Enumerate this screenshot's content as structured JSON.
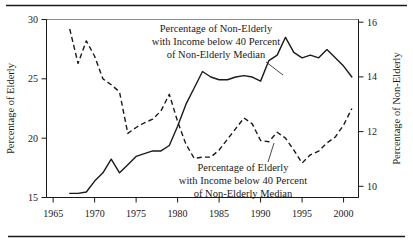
{
  "chart_data": {
    "type": "line",
    "title": "",
    "xlabel": "",
    "ylabel": "Percentage of Elderly",
    "y2label": "Percentage of Non-Elderly",
    "xlim": [
      1964.2,
      2001.8
    ],
    "ylim": [
      15,
      30
    ],
    "y2lim": [
      9.6,
      16.1
    ],
    "xticks": [
      1965,
      1970,
      1975,
      1980,
      1985,
      1990,
      1995,
      2000
    ],
    "yticks": [
      15,
      20,
      25,
      30
    ],
    "y2ticks": [
      10,
      12,
      14,
      16
    ],
    "grid": false,
    "legend_position": "inline-annotations",
    "series": [
      {
        "name": "Percentage of Elderly with Income below 40 Percent of Non-Elderly Median",
        "axis": "left",
        "style": "dashed",
        "x": [
          1967,
          1968,
          1969,
          1970,
          1971,
          1972,
          1973,
          1974,
          1975,
          1976,
          1977,
          1978,
          1979,
          1980,
          1981,
          1982,
          1983,
          1984,
          1985,
          1986,
          1987,
          1988,
          1989,
          1990,
          1991,
          1992,
          1993,
          1994,
          1995,
          1996,
          1997,
          1998,
          1999,
          2000,
          2001
        ],
        "values": [
          29.2,
          26.3,
          28.2,
          26.9,
          25.0,
          24.5,
          23.9,
          20.4,
          20.9,
          21.3,
          21.6,
          22.3,
          23.7,
          21.4,
          19.5,
          18.3,
          18.4,
          18.4,
          19.0,
          19.9,
          20.8,
          21.7,
          21.2,
          19.8,
          19.7,
          20.5,
          20.0,
          19.0,
          17.9,
          18.6,
          18.9,
          19.6,
          20.1,
          21.1,
          22.5
        ]
      },
      {
        "name": "Percentage of Non-Elderly with Income below 40 Percent of Non-Elderly Median",
        "axis": "right",
        "style": "solid",
        "x": [
          1967,
          1968,
          1969,
          1970,
          1971,
          1972,
          1973,
          1974,
          1975,
          1976,
          1977,
          1978,
          1979,
          1980,
          1981,
          1982,
          1983,
          1984,
          1985,
          1986,
          1987,
          1988,
          1989,
          1990,
          1991,
          1992,
          1993,
          1994,
          1995,
          1996,
          1997,
          1998,
          1999,
          2000,
          2001
        ],
        "values": [
          9.75,
          9.75,
          9.8,
          10.2,
          10.5,
          11.0,
          10.5,
          10.8,
          11.1,
          11.2,
          11.3,
          11.3,
          11.5,
          12.2,
          13.0,
          13.6,
          14.2,
          14.0,
          13.9,
          13.9,
          14.0,
          14.05,
          14.0,
          13.85,
          14.6,
          14.8,
          15.45,
          14.9,
          14.7,
          14.8,
          14.7,
          15.0,
          14.7,
          14.4,
          14.0
        ]
      }
    ],
    "annotations": [
      {
        "id": "non-elderly-annotation",
        "lines": [
          "Percentage of Non-Elderly",
          "with Income below 40 Percent",
          "of Non-Elderly Median"
        ]
      },
      {
        "id": "elderly-annotation",
        "lines": [
          "Percentage of Elderly",
          "with Income below 40 Percent",
          "of Non-Elderly Median"
        ]
      }
    ]
  },
  "axes": {
    "left_title": "Percentage of Elderly",
    "right_title": "Percentage of Non-Elderly"
  },
  "colors": {
    "ink": "#1a1a1a",
    "frame": "#8c8c8c",
    "background": "#ffffff"
  }
}
